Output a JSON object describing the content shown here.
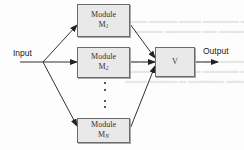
{
  "diagram": {
    "input_label": "Input",
    "output_label": "Output",
    "modules": [
      {
        "title": "Module",
        "symbol": "M",
        "subscript": "1"
      },
      {
        "title": "Module",
        "symbol": "M",
        "subscript": "2"
      },
      {
        "title": "Module",
        "symbol": "M",
        "subscript": "N"
      }
    ],
    "combiner": {
      "label": "V"
    },
    "ellipsis": "⋮",
    "colors": {
      "box_fill": "#e9e9e9",
      "box_border": "#6b6b6b",
      "line": "#333333",
      "text": "#222222"
    }
  }
}
